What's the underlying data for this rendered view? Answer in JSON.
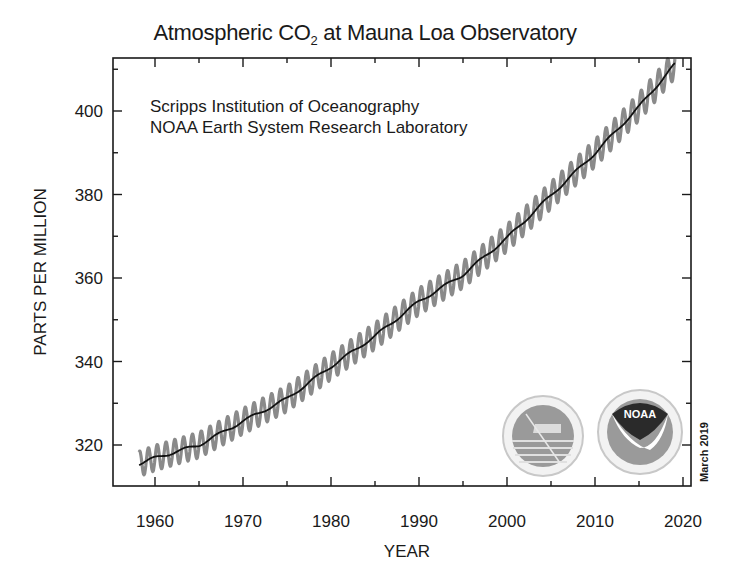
{
  "title": {
    "prefix": "Atmospheric CO",
    "subscript": "2",
    "suffix": " at Mauna Loa Observatory"
  },
  "credits": {
    "line1": "Scripps Institution of Oceanography",
    "line2": "NOAA Earth System Research Laboratory"
  },
  "stamp": "March 2019",
  "logos": {
    "left": "scripps-logo",
    "right": "noaa-logo",
    "right_text": "NOAA"
  },
  "chart_data": {
    "type": "line",
    "title": "Atmospheric CO2 at Mauna Loa Observatory",
    "xlabel": "YEAR",
    "ylabel": "PARTS PER MILLION",
    "xlim": [
      1956,
      2021
    ],
    "ylim": [
      310,
      413
    ],
    "x_ticks": [
      1960,
      1970,
      1980,
      1990,
      2000,
      2010,
      2020
    ],
    "y_ticks": [
      320,
      340,
      360,
      380,
      400
    ],
    "grid": false,
    "legend": null,
    "annotations": [
      "Scripps Institution of Oceanography",
      "NOAA Earth System Research Laboratory",
      "March 2019"
    ],
    "series": [
      {
        "name": "Monthly mean (seasonal cycle)",
        "color": "#8a8a8a",
        "seasonal_amplitude_ppm": 3.2,
        "x": [
          1958,
          1960,
          1965,
          1970,
          1975,
          1980,
          1985,
          1990,
          1995,
          2000,
          2005,
          2010,
          2015,
          2019
        ],
        "y": [
          315.3,
          316.9,
          320.0,
          325.7,
          331.1,
          338.8,
          346.1,
          354.4,
          360.8,
          369.6,
          379.8,
          389.9,
          401.0,
          411.0
        ]
      },
      {
        "name": "Seasonally corrected trend",
        "color": "#111111",
        "x": [
          1958,
          1960,
          1965,
          1970,
          1975,
          1980,
          1985,
          1990,
          1995,
          2000,
          2005,
          2010,
          2015,
          2019
        ],
        "y": [
          315.3,
          316.9,
          320.0,
          325.7,
          331.1,
          338.8,
          346.1,
          354.4,
          360.8,
          369.6,
          379.8,
          389.9,
          401.0,
          411.0
        ]
      }
    ]
  }
}
